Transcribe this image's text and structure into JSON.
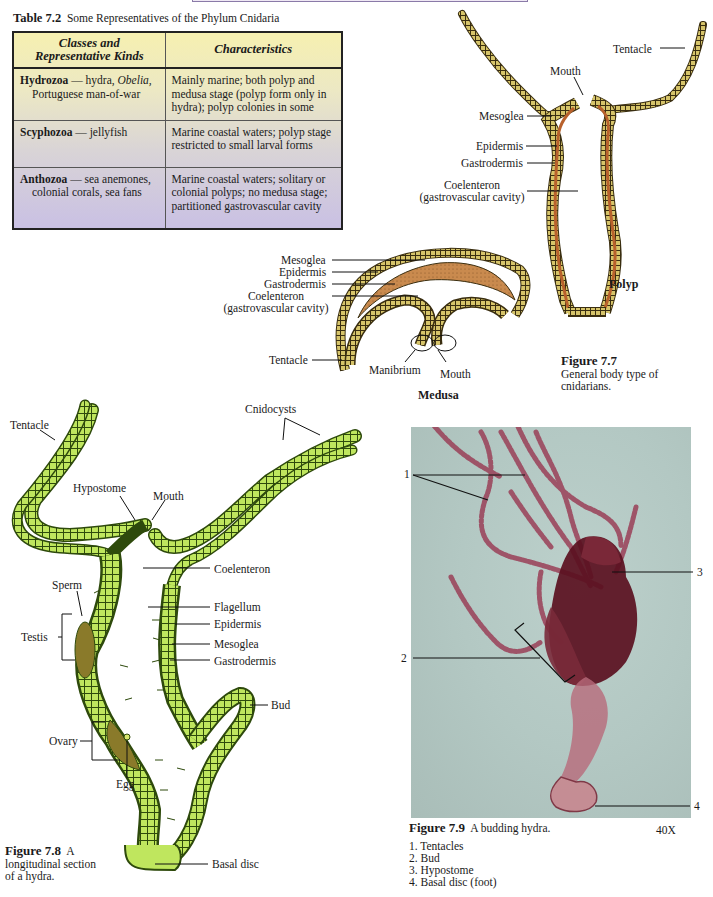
{
  "table": {
    "caption_number": "Table 7.2",
    "caption_text": "Some Representatives of the Phylum Cnidaria",
    "headers": [
      "Classes and Representative Kinds",
      "Characteristics"
    ],
    "header_col1_line1": "Classes and",
    "header_col1_line2": "Representative Kinds",
    "rows": [
      {
        "class": "Hydrozoa",
        "kinds_line1": "— hydra, ",
        "kinds_italic": "Obelia,",
        "kinds_line2": "Portuguese man-of-war",
        "characteristics": "Mainly marine; both polyp and medusa stage (polyp form only in hydra); polyp colonies in some"
      },
      {
        "class": "Scyphozoa",
        "kinds_line1": "— jellyfish",
        "kinds_line2": "",
        "characteristics": "Marine coastal waters; polyp stage restricted to small larval forms"
      },
      {
        "class": "Anthozoa",
        "kinds_line1": "— sea anemones,",
        "kinds_line2": "colonial corals, sea fans",
        "characteristics": "Marine coastal waters; solitary or colonial polyps; no medusa stage; partitioned gastrovascular cavity"
      }
    ]
  },
  "figure_7_7": {
    "polyp_labels": {
      "tentacle": "Tentacle",
      "mouth": "Mouth",
      "mesoglea": "Mesoglea",
      "epidermis": "Epidermis",
      "gastrodermis": "Gastrodermis",
      "coelenteron": "Coelenteron",
      "coelenteron_sub": "(gastrovascular cavity)",
      "title": "Polyp"
    },
    "medusa_labels": {
      "mesoglea": "Mesoglea",
      "epidermis": "Epidermis",
      "gastrodermis": "Gastrodermis",
      "coelenteron": "Coelenteron",
      "coelenteron_sub": "(gastrovascular cavity)",
      "tentacle": "Tentacle",
      "manibrium": "Manibrium",
      "mouth": "Mouth",
      "title": "Medusa"
    },
    "caption_number": "Figure 7.7",
    "caption_line1": "General body type of",
    "caption_line2": "cnidarians."
  },
  "figure_7_8": {
    "labels": {
      "tentacle": "Tentacle",
      "cnidocysts": "Cnidocysts",
      "hypostome": "Hypostome",
      "mouth": "Mouth",
      "coelenteron": "Coelenteron",
      "sperm": "Sperm",
      "testis": "Testis",
      "flagellum": "Flagellum",
      "epidermis": "Epidermis",
      "mesoglea": "Mesoglea",
      "gastrodermis": "Gastrodermis",
      "bud": "Bud",
      "ovary": "Ovary",
      "egg": "Egg",
      "basal_disc": "Basal disc"
    },
    "caption_number": "Figure 7.8",
    "caption_line1": "A",
    "caption_line2": "longitudinal section",
    "caption_line3": "of a hydra."
  },
  "figure_7_9": {
    "callouts": [
      "1",
      "2",
      "3",
      "4"
    ],
    "caption_number": "Figure 7.9",
    "caption_text": "A budding hydra.",
    "magnification": "40X",
    "legend": [
      "1. Tentacles",
      "2. Bud",
      "3. Hypostome",
      "4. Basal disc (foot)"
    ]
  },
  "colors": {
    "table_top": "#f6f0b0",
    "table_bottom": "#c9c0e4",
    "polyp_body": "#b8612c",
    "polyp_cells": "#d8c870",
    "medusa_mesoglea": "#c98a4e",
    "hydra_green": "#b8e05a",
    "hydra_dark": "#3a5410",
    "photo_bg": "#b3c8c3",
    "photo_stain": "#8a3348"
  }
}
